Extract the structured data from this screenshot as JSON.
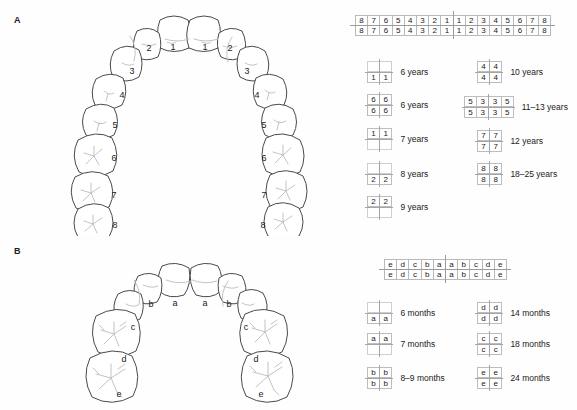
{
  "figure": {
    "panel_a_label": "A",
    "panel_b_label": "B"
  },
  "panel_a": {
    "arch_labels_left": [
      "1",
      "2",
      "3",
      "4",
      "5",
      "6",
      "7",
      "8"
    ],
    "arch_labels_right": [
      "1",
      "2",
      "3",
      "4",
      "5",
      "6",
      "7",
      "8"
    ],
    "formula": {
      "upper": [
        "8",
        "7",
        "6",
        "5",
        "4",
        "3",
        "2",
        "1",
        "1",
        "2",
        "3",
        "4",
        "5",
        "6",
        "7",
        "8"
      ],
      "lower": [
        "8",
        "7",
        "6",
        "5",
        "4",
        "3",
        "2",
        "1",
        "1",
        "2",
        "3",
        "4",
        "5",
        "6",
        "7",
        "8"
      ]
    },
    "legend": [
      {
        "id": "a1",
        "upper": [
          "",
          ""
        ],
        "lower": [
          "1",
          "1"
        ],
        "age": "6 years"
      },
      {
        "id": "a2",
        "upper": [
          "6",
          "6"
        ],
        "lower": [
          "6",
          "6"
        ],
        "age": "6 years"
      },
      {
        "id": "a3",
        "upper": [
          "1",
          "1"
        ],
        "lower": [
          "",
          ""
        ],
        "age": "7 years"
      },
      {
        "id": "a4",
        "upper": [
          "",
          ""
        ],
        "lower": [
          "2",
          "2"
        ],
        "age": "8 years"
      },
      {
        "id": "a5",
        "upper": [
          "2",
          "2"
        ],
        "lower": [
          "",
          ""
        ],
        "age": "9 years"
      },
      {
        "id": "a6",
        "upper": [
          "4",
          "4"
        ],
        "lower": [
          "4",
          "4"
        ],
        "age": "10 years"
      },
      {
        "id": "a7",
        "upper": [
          "5",
          "3",
          "3",
          "5"
        ],
        "lower": [
          "5",
          "3",
          "3",
          "5"
        ],
        "age": "11–13 years"
      },
      {
        "id": "a8",
        "upper": [
          "7",
          "7"
        ],
        "lower": [
          "7",
          "7"
        ],
        "age": "12 years"
      },
      {
        "id": "a9",
        "upper": [
          "8",
          "8"
        ],
        "lower": [
          "8",
          "8"
        ],
        "age": "18–25 years"
      }
    ]
  },
  "panel_b": {
    "arch_labels_left": [
      "a",
      "b",
      "c",
      "d",
      "e"
    ],
    "arch_labels_right": [
      "a",
      "b",
      "c",
      "d",
      "e"
    ],
    "formula": {
      "upper": [
        "e",
        "d",
        "c",
        "b",
        "a",
        "a",
        "b",
        "c",
        "d",
        "e"
      ],
      "lower": [
        "e",
        "d",
        "c",
        "b",
        "a",
        "a",
        "b",
        "c",
        "d",
        "e"
      ]
    },
    "legend": [
      {
        "id": "b1",
        "upper": [
          "",
          ""
        ],
        "lower": [
          "a",
          "a"
        ],
        "age": "6 months"
      },
      {
        "id": "b2",
        "upper": [
          "a",
          "a"
        ],
        "lower": [
          "",
          ""
        ],
        "age": "7 months"
      },
      {
        "id": "b3",
        "upper": [
          "b",
          "b"
        ],
        "lower": [
          "b",
          "b"
        ],
        "age": "8–9 months"
      },
      {
        "id": "b4",
        "upper": [
          "d",
          "d"
        ],
        "lower": [
          "d",
          "d"
        ],
        "age": "14 months"
      },
      {
        "id": "b5",
        "upper": [
          "c",
          "c"
        ],
        "lower": [
          "c",
          "c"
        ],
        "age": "18 months"
      },
      {
        "id": "b6",
        "upper": [
          "e",
          "e"
        ],
        "lower": [
          "e",
          "e"
        ],
        "age": "24 months"
      }
    ]
  },
  "colors": {
    "outline": "#4a4a4a",
    "detail": "#b0b0b0",
    "grid": "#bdbdbd",
    "text": "#1a1a1a",
    "background": "#fefefe"
  }
}
